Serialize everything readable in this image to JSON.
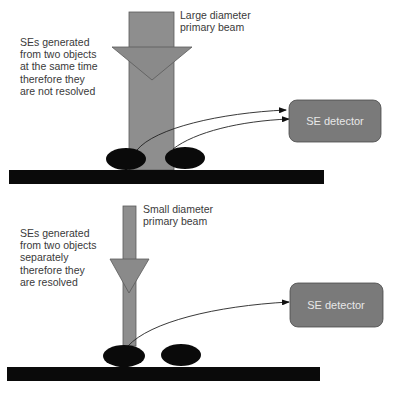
{
  "panels": [
    {
      "id": "large",
      "beam_label": [
        "Large diameter",
        "primary beam"
      ],
      "description": [
        "SEs generated",
        "from two objects",
        "at the same time",
        "therefore they",
        "are not resolved"
      ],
      "detector_label": "SE detector"
    },
    {
      "id": "small",
      "beam_label": [
        "Small diameter",
        "primary beam"
      ],
      "description": [
        "SEs generated",
        "from two objects",
        "separately",
        "therefore they",
        "are resolved"
      ],
      "detector_label": "SE detector"
    }
  ],
  "colors": {
    "beam": "#8e8e8e",
    "beam_border": "#5a5a5a",
    "object": "#0a0a0a",
    "substrate": "#0a0a0a",
    "detector": "#7a7a7a",
    "detector_border": "#4a4a4a",
    "text": "#3a3a3a"
  }
}
